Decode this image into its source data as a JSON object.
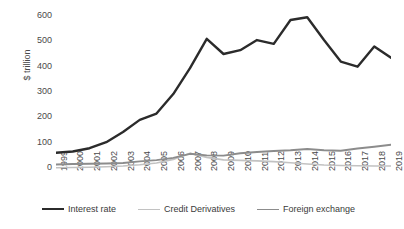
{
  "chart_data": {
    "type": "line",
    "title": "",
    "xlabel": "",
    "ylabel": "$ trillion",
    "ylim": [
      0,
      600
    ],
    "yticks": [
      0,
      100,
      200,
      300,
      400,
      500,
      600
    ],
    "grid": false,
    "legend_position": "bottom",
    "x": [
      1999,
      2000,
      2001,
      2002,
      2003,
      2004,
      2005,
      2006,
      2007,
      2008,
      2009,
      2010,
      2011,
      2012,
      2013,
      2014,
      2015,
      2016,
      2017,
      2018,
      2019
    ],
    "categories": [
      "1999",
      "2000",
      "2001",
      "2002",
      "2003",
      "2004",
      "2005",
      "2006",
      "2007",
      "2008",
      "2009",
      "2010",
      "2011",
      "2012",
      "2013",
      "2014",
      "2015",
      "2016",
      "2017",
      "2018",
      "2019"
    ],
    "series": [
      {
        "name": "Interest rate",
        "color": "#2b2b2b",
        "width": 2.4,
        "values": [
          60,
          65,
          78,
          102,
          142,
          190,
          215,
          292,
          394,
          510,
          450,
          465,
          505,
          490,
          584,
          595,
          505,
          420,
          400,
          480,
          435
        ]
      },
      {
        "name": "Credit Derivatives",
        "color": "#c2c2c2",
        "width": 1.6,
        "values": [
          1,
          2,
          3,
          5,
          8,
          13,
          20,
          34,
          58,
          42,
          32,
          30,
          28,
          25,
          21,
          16,
          12,
          10,
          9,
          8,
          8
        ]
      },
      {
        "name": "Foreign exchange",
        "color": "#8c8c8c",
        "width": 1.9,
        "values": [
          14,
          16,
          17,
          18,
          20,
          26,
          31,
          40,
          56,
          50,
          49,
          58,
          63,
          67,
          70,
          75,
          70,
          68,
          77,
          84,
          92
        ]
      }
    ]
  },
  "legend": {
    "items": [
      {
        "label": "Interest rate"
      },
      {
        "label": "Credit Derivatives"
      },
      {
        "label": "Foreign exchange"
      }
    ]
  }
}
